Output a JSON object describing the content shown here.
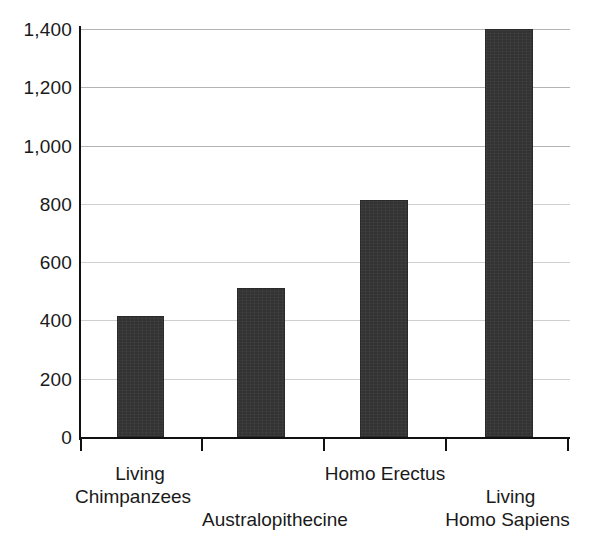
{
  "chart_data": {
    "type": "bar",
    "title": "",
    "subtitle": "",
    "xlabel": "",
    "ylabel": "",
    "categories": [
      "Living Chimpanzees",
      "Australopithecine",
      "Homo Erectus",
      "Living Homo Sapiens"
    ],
    "values": [
      415,
      512,
      815,
      1400
    ],
    "ylim": [
      0,
      1400
    ],
    "y_ticks": [
      0,
      200,
      400,
      600,
      800,
      1000,
      1200,
      1400
    ],
    "y_tick_labels": [
      "0",
      "200",
      "400",
      "600",
      "800",
      "1,000",
      "1,200",
      "1,400"
    ],
    "grid": "horizontal",
    "legend": "none",
    "bar_color": "#333333",
    "gridline_color": "#b4b4b4",
    "axis_color": "#111111",
    "background": "#ffffff"
  },
  "axis": {
    "y_labels": [
      {
        "text": "1,400",
        "value": 1400
      },
      {
        "text": "1,200",
        "value": 1200
      },
      {
        "text": "1,000",
        "value": 1000
      },
      {
        "text": "800",
        "value": 800
      },
      {
        "text": "600",
        "value": 600
      },
      {
        "text": "400",
        "value": 400
      },
      {
        "text": "200",
        "value": 200
      },
      {
        "text": "0",
        "value": 0
      }
    ]
  },
  "categories": [
    {
      "line1": "Living",
      "line2": "Chimpanzees"
    },
    {
      "line1": "Australopithecine",
      "line2": ""
    },
    {
      "line1": "Homo Erectus",
      "line2": ""
    },
    {
      "line1": "Living",
      "line2": "Homo Sapiens"
    }
  ]
}
